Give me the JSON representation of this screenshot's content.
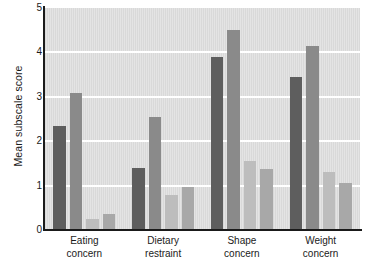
{
  "chart_data": {
    "type": "bar",
    "title": "",
    "xlabel": "",
    "ylabel": "Mean subscale score",
    "ylim": [
      0,
      5
    ],
    "yticks": [
      0,
      1,
      2,
      3,
      4,
      5
    ],
    "ytick_labels": [
      "0",
      "1",
      "2",
      "3",
      "4",
      "5"
    ],
    "grid": true,
    "gridlines_at": [
      1,
      2,
      3,
      4
    ],
    "legend": "none",
    "legend_position": "none",
    "categories": [
      "Eating concern",
      "Dietary restraint",
      "Shape concern",
      "Weight concern"
    ],
    "category_lines": [
      [
        "Eating",
        "concern"
      ],
      [
        "Dietary",
        "restraint"
      ],
      [
        "Shape",
        "concern"
      ],
      [
        "Weight",
        "concern"
      ]
    ],
    "series": [
      {
        "name": "Series 1",
        "color": "#5e5e5e",
        "values": [
          2.35,
          1.4,
          3.9,
          3.45
        ]
      },
      {
        "name": "Series 2",
        "color": "#8a8a8a",
        "values": [
          3.08,
          2.55,
          4.5,
          4.15
        ]
      },
      {
        "name": "Series 3",
        "color": "#bdbdbd",
        "values": [
          0.25,
          0.78,
          1.55,
          1.3
        ]
      },
      {
        "name": "Series 4",
        "color": "#a8a8a8",
        "values": [
          0.35,
          0.98,
          1.38,
          1.05
        ]
      }
    ],
    "plot_background": "#d9d9d9",
    "gridline_color": "#ffffff",
    "axis_color": "#1a1a1a",
    "text_color": "#1a1a1a"
  }
}
